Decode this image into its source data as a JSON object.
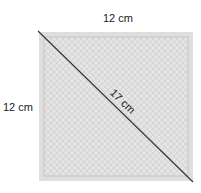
{
  "diagram": {
    "shape": "square",
    "top_side_label": "12 cm",
    "left_side_label": "12 cm",
    "diagonal_label": "17 cm",
    "colors": {
      "fill": "#e2e2e2",
      "border": "#d6d6d6",
      "inner_line": "#c8c8c8",
      "hatch": "#cfcfcf",
      "diagonal": "#333333",
      "text": "#222222"
    }
  }
}
